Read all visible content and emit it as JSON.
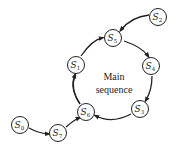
{
  "diagram": {
    "center_label": {
      "line1": "Main",
      "line2": "sequence"
    },
    "nodes": [
      {
        "id": "S0",
        "letter": "S",
        "sub": "0",
        "x": 20,
        "y": 125
      },
      {
        "id": "S7",
        "letter": "S",
        "sub": "7",
        "x": 58,
        "y": 133
      },
      {
        "id": "S6",
        "letter": "S",
        "sub": "6",
        "x": 86,
        "y": 112
      },
      {
        "id": "S1",
        "letter": "S",
        "sub": "1",
        "x": 76,
        "y": 65
      },
      {
        "id": "S5",
        "letter": "S",
        "sub": "5",
        "x": 113,
        "y": 38
      },
      {
        "id": "S2",
        "letter": "S",
        "sub": "2",
        "x": 158,
        "y": 17
      },
      {
        "id": "S4",
        "letter": "S",
        "sub": "4",
        "x": 151,
        "y": 66
      },
      {
        "id": "S3",
        "letter": "S",
        "sub": "3",
        "x": 140,
        "y": 109
      }
    ],
    "edges": [
      {
        "from": "S0",
        "to": "S7"
      },
      {
        "from": "S7",
        "to": "S6"
      },
      {
        "from": "S6",
        "to": "S1"
      },
      {
        "from": "S1",
        "to": "S5"
      },
      {
        "from": "S5",
        "to": "S4"
      },
      {
        "from": "S4",
        "to": "S3"
      },
      {
        "from": "S3",
        "to": "S6"
      },
      {
        "from": "S2",
        "to": "S5"
      }
    ],
    "colors": {
      "stroke": "#222222",
      "background": "#ffffff"
    }
  }
}
